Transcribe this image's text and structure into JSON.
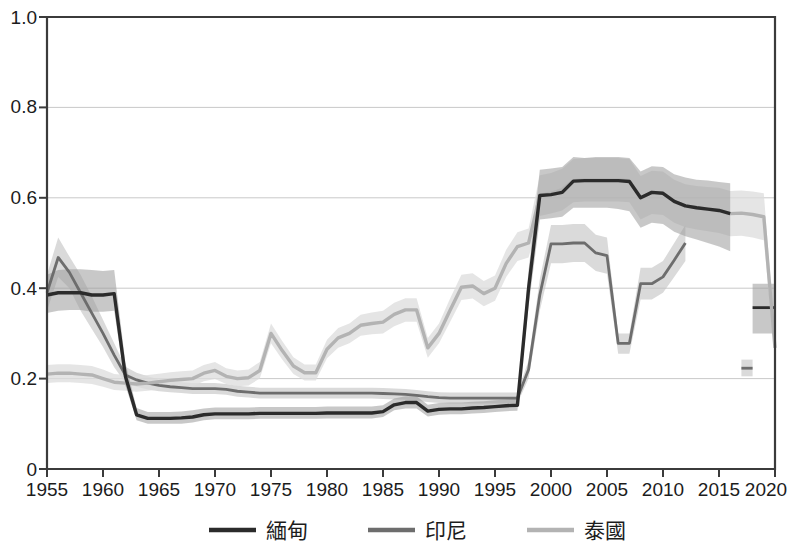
{
  "chart_data": {
    "type": "line",
    "title": "",
    "subtitle": "",
    "xlabel": "",
    "ylabel": "",
    "xlim": [
      1955,
      2020
    ],
    "ylim": [
      0,
      1.0
    ],
    "grid": true,
    "legend_position": "bottom",
    "x_ticks": [
      "1955",
      "1960",
      "1965",
      "1970",
      "1975",
      "1980",
      "1985",
      "1990",
      "1995",
      "2000",
      "2005",
      "2010",
      "2015",
      "2020"
    ],
    "x_tick_values": [
      1955,
      1960,
      1965,
      1970,
      1975,
      1980,
      1985,
      1990,
      1995,
      2000,
      2005,
      2010,
      2015,
      2020
    ],
    "y_ticks": [
      "0",
      "0.2",
      "0.4",
      "0.6",
      "0.8",
      "1.0"
    ],
    "y_tick_values": [
      0,
      0.2,
      0.4,
      0.6,
      0.8,
      1.0
    ],
    "series": [
      {
        "name": "緬甸",
        "color": "#2b2b2b",
        "band_color": "#9a9a9a",
        "band_opacity": 0.55,
        "x": [
          1955,
          1956,
          1957,
          1958,
          1959,
          1960,
          1961,
          1962,
          1963,
          1964,
          1965,
          1966,
          1967,
          1968,
          1969,
          1970,
          1971,
          1972,
          1973,
          1974,
          1975,
          1976,
          1977,
          1978,
          1979,
          1980,
          1981,
          1982,
          1983,
          1984,
          1985,
          1986,
          1987,
          1988,
          1989,
          1990,
          1991,
          1992,
          1993,
          1994,
          1995,
          1996,
          1997,
          1998,
          1999,
          2000,
          2001,
          2002,
          2003,
          2004,
          2005,
          2006,
          2007,
          2008,
          2009,
          2010,
          2011,
          2012,
          2013,
          2014,
          2015,
          2016
        ],
        "values": [
          0.385,
          0.39,
          0.39,
          0.39,
          0.385,
          0.385,
          0.388,
          0.205,
          0.12,
          0.112,
          0.112,
          0.112,
          0.113,
          0.115,
          0.12,
          0.122,
          0.122,
          0.122,
          0.122,
          0.123,
          0.123,
          0.123,
          0.123,
          0.123,
          0.123,
          0.124,
          0.124,
          0.124,
          0.124,
          0.124,
          0.127,
          0.142,
          0.147,
          0.147,
          0.128,
          0.132,
          0.133,
          0.133,
          0.135,
          0.136,
          0.138,
          0.14,
          0.141,
          0.4,
          0.605,
          0.607,
          0.612,
          0.637,
          0.638,
          0.638,
          0.638,
          0.638,
          0.636,
          0.6,
          0.612,
          0.61,
          0.592,
          0.582,
          0.578,
          0.575,
          0.572,
          0.565
        ],
        "lower": [
          0.345,
          0.35,
          0.352,
          0.352,
          0.348,
          0.348,
          0.35,
          0.185,
          0.108,
          0.1,
          0.1,
          0.1,
          0.1,
          0.103,
          0.108,
          0.11,
          0.11,
          0.11,
          0.11,
          0.111,
          0.111,
          0.111,
          0.111,
          0.111,
          0.111,
          0.112,
          0.112,
          0.112,
          0.112,
          0.112,
          0.115,
          0.13,
          0.134,
          0.134,
          0.116,
          0.12,
          0.121,
          0.121,
          0.123,
          0.124,
          0.126,
          0.128,
          0.129,
          0.36,
          0.552,
          0.555,
          0.558,
          0.578,
          0.578,
          0.578,
          0.578,
          0.575,
          0.57,
          0.534,
          0.545,
          0.542,
          0.525,
          0.515,
          0.508,
          0.5,
          0.492,
          0.482
        ],
        "upper": [
          0.43,
          0.44,
          0.442,
          0.442,
          0.44,
          0.438,
          0.44,
          0.235,
          0.135,
          0.126,
          0.126,
          0.126,
          0.127,
          0.13,
          0.134,
          0.136,
          0.136,
          0.136,
          0.136,
          0.137,
          0.137,
          0.137,
          0.137,
          0.137,
          0.137,
          0.138,
          0.138,
          0.138,
          0.138,
          0.138,
          0.141,
          0.156,
          0.161,
          0.161,
          0.142,
          0.146,
          0.147,
          0.147,
          0.149,
          0.15,
          0.152,
          0.154,
          0.155,
          0.44,
          0.662,
          0.665,
          0.668,
          0.69,
          0.688,
          0.69,
          0.69,
          0.69,
          0.688,
          0.658,
          0.67,
          0.668,
          0.652,
          0.645,
          0.64,
          0.638,
          0.635,
          0.632
        ]
      },
      {
        "name": "緬甸-tail",
        "color": "#2b2b2b",
        "band_color": "#9a9a9a",
        "band_opacity": 0.55,
        "legend_hidden": true,
        "x": [
          2018,
          2019,
          2020
        ],
        "values": [
          0.357,
          0.357,
          0.357
        ],
        "lower": [
          0.3,
          0.3,
          0.3
        ],
        "upper": [
          0.41,
          0.41,
          0.41
        ]
      },
      {
        "name": "印尼",
        "color": "#6d6d6d",
        "band_color": "#c2c2c2",
        "band_opacity": 0.6,
        "x": [
          1955,
          1956,
          1957,
          1958,
          1959,
          1960,
          1961,
          1962,
          1963,
          1964,
          1965,
          1966,
          1967,
          1968,
          1969,
          1970,
          1971,
          1972,
          1973,
          1974,
          1975,
          1976,
          1977,
          1978,
          1979,
          1980,
          1981,
          1982,
          1983,
          1984,
          1985,
          1986,
          1987,
          1988,
          1989,
          1990,
          1991,
          1992,
          1993,
          1994,
          1995,
          1996,
          1997,
          1998,
          1999,
          2000,
          2001,
          2002,
          2003,
          2004,
          2005,
          2006,
          2007,
          2008,
          2009,
          2010,
          2011,
          2012
        ],
        "values": [
          0.39,
          0.468,
          0.435,
          0.39,
          0.345,
          0.3,
          0.252,
          0.208,
          0.197,
          0.19,
          0.185,
          0.182,
          0.18,
          0.178,
          0.178,
          0.178,
          0.176,
          0.172,
          0.17,
          0.168,
          0.168,
          0.168,
          0.168,
          0.168,
          0.168,
          0.168,
          0.168,
          0.168,
          0.168,
          0.168,
          0.167,
          0.166,
          0.165,
          0.163,
          0.16,
          0.158,
          0.157,
          0.157,
          0.157,
          0.157,
          0.157,
          0.157,
          0.157,
          0.22,
          0.385,
          0.498,
          0.498,
          0.5,
          0.5,
          0.478,
          0.472,
          0.278,
          0.278,
          0.41,
          0.41,
          0.425,
          0.462,
          0.5
        ],
        "lower": [
          0.35,
          0.425,
          0.4,
          0.35,
          0.31,
          0.27,
          0.225,
          0.19,
          0.182,
          0.176,
          0.172,
          0.17,
          0.168,
          0.166,
          0.166,
          0.166,
          0.164,
          0.16,
          0.158,
          0.156,
          0.156,
          0.156,
          0.156,
          0.156,
          0.156,
          0.156,
          0.156,
          0.156,
          0.156,
          0.156,
          0.155,
          0.154,
          0.153,
          0.151,
          0.148,
          0.146,
          0.145,
          0.145,
          0.145,
          0.145,
          0.145,
          0.145,
          0.145,
          0.2,
          0.35,
          0.455,
          0.455,
          0.458,
          0.458,
          0.438,
          0.432,
          0.255,
          0.255,
          0.375,
          0.375,
          0.39,
          0.425,
          0.46
        ],
        "upper": [
          0.43,
          0.512,
          0.47,
          0.43,
          0.382,
          0.33,
          0.278,
          0.226,
          0.213,
          0.205,
          0.198,
          0.195,
          0.192,
          0.19,
          0.19,
          0.19,
          0.188,
          0.184,
          0.182,
          0.18,
          0.18,
          0.18,
          0.18,
          0.18,
          0.18,
          0.18,
          0.18,
          0.18,
          0.18,
          0.18,
          0.179,
          0.178,
          0.177,
          0.175,
          0.172,
          0.17,
          0.169,
          0.169,
          0.169,
          0.169,
          0.169,
          0.169,
          0.169,
          0.24,
          0.42,
          0.54,
          0.54,
          0.542,
          0.542,
          0.518,
          0.512,
          0.3,
          0.3,
          0.445,
          0.445,
          0.46,
          0.5,
          0.54
        ]
      },
      {
        "name": "印尼-tail",
        "color": "#6d6d6d",
        "band_color": "#c2c2c2",
        "band_opacity": 0.6,
        "legend_hidden": true,
        "x": [
          2017,
          2018
        ],
        "values": [
          0.223,
          0.223
        ],
        "lower": [
          0.205,
          0.205
        ],
        "upper": [
          0.242,
          0.242
        ]
      },
      {
        "name": "泰國",
        "color": "#b3b3b3",
        "band_color": "#dcdcdc",
        "band_opacity": 0.75,
        "x": [
          1955,
          1956,
          1957,
          1958,
          1959,
          1960,
          1961,
          1962,
          1963,
          1964,
          1965,
          1966,
          1967,
          1968,
          1969,
          1970,
          1971,
          1972,
          1973,
          1974,
          1975,
          1976,
          1977,
          1978,
          1979,
          1980,
          1981,
          1982,
          1983,
          1984,
          1985,
          1986,
          1987,
          1988,
          1989,
          1990,
          1991,
          1992,
          1993,
          1994,
          1995,
          1996,
          1997,
          1998,
          1999,
          2000,
          2001,
          2002,
          2003,
          2004,
          2005,
          2006,
          2007,
          2008,
          2009,
          2010,
          2011,
          2012,
          2013,
          2014,
          2015,
          2016,
          2017,
          2018,
          2019,
          2020
        ],
        "values": [
          0.21,
          0.212,
          0.212,
          0.21,
          0.208,
          0.2,
          0.192,
          0.19,
          0.188,
          0.19,
          0.193,
          0.196,
          0.198,
          0.2,
          0.212,
          0.218,
          0.205,
          0.2,
          0.202,
          0.218,
          0.3,
          0.262,
          0.228,
          0.213,
          0.213,
          0.265,
          0.29,
          0.3,
          0.318,
          0.322,
          0.325,
          0.342,
          0.352,
          0.352,
          0.268,
          0.3,
          0.352,
          0.402,
          0.405,
          0.388,
          0.4,
          0.455,
          0.492,
          0.5,
          0.605,
          0.61,
          0.618,
          0.638,
          0.64,
          0.64,
          0.64,
          0.64,
          0.638,
          0.6,
          0.612,
          0.61,
          0.592,
          0.582,
          0.578,
          0.575,
          0.572,
          0.565,
          0.566,
          0.563,
          0.558,
          0.268
        ],
        "lower": [
          0.19,
          0.192,
          0.192,
          0.19,
          0.188,
          0.182,
          0.175,
          0.173,
          0.171,
          0.173,
          0.176,
          0.179,
          0.181,
          0.183,
          0.194,
          0.199,
          0.188,
          0.183,
          0.185,
          0.2,
          0.278,
          0.242,
          0.21,
          0.196,
          0.196,
          0.245,
          0.268,
          0.278,
          0.295,
          0.298,
          0.3,
          0.316,
          0.326,
          0.326,
          0.246,
          0.278,
          0.326,
          0.374,
          0.377,
          0.36,
          0.372,
          0.425,
          0.46,
          0.468,
          0.56,
          0.565,
          0.572,
          0.59,
          0.592,
          0.592,
          0.592,
          0.592,
          0.59,
          0.552,
          0.564,
          0.562,
          0.545,
          0.535,
          0.53,
          0.526,
          0.522,
          0.515,
          0.516,
          0.512,
          0.506,
          0.245
        ],
        "upper": [
          0.23,
          0.232,
          0.232,
          0.23,
          0.228,
          0.22,
          0.21,
          0.208,
          0.206,
          0.208,
          0.211,
          0.214,
          0.216,
          0.218,
          0.23,
          0.237,
          0.223,
          0.218,
          0.22,
          0.237,
          0.322,
          0.283,
          0.247,
          0.231,
          0.231,
          0.286,
          0.312,
          0.322,
          0.341,
          0.346,
          0.35,
          0.368,
          0.378,
          0.378,
          0.29,
          0.322,
          0.378,
          0.43,
          0.433,
          0.416,
          0.428,
          0.485,
          0.524,
          0.532,
          0.65,
          0.655,
          0.664,
          0.686,
          0.688,
          0.688,
          0.688,
          0.688,
          0.686,
          0.648,
          0.66,
          0.658,
          0.64,
          0.63,
          0.626,
          0.624,
          0.622,
          0.615,
          0.616,
          0.614,
          0.61,
          0.292
        ]
      }
    ],
    "legend": [
      {
        "label": "緬甸",
        "color": "#2b2b2b"
      },
      {
        "label": "印尼",
        "color": "#6d6d6d"
      },
      {
        "label": "泰國",
        "color": "#b3b3b3"
      }
    ]
  },
  "axes": {
    "y_tick_0": "0",
    "y_tick_1": "0.2",
    "y_tick_2": "0.4",
    "y_tick_3": "0.6",
    "y_tick_4": "0.8",
    "y_tick_5": "1.0",
    "x_tick_0": "1955",
    "x_tick_1": "1960",
    "x_tick_2": "1965",
    "x_tick_3": "1970",
    "x_tick_4": "1975",
    "x_tick_5": "1980",
    "x_tick_6": "1985",
    "x_tick_7": "1990",
    "x_tick_8": "1995",
    "x_tick_9": "2000",
    "x_tick_10": "2005",
    "x_tick_11": "2010",
    "x_tick_12": "2015",
    "x_tick_13": "2020"
  },
  "legend": {
    "item_0": "緬甸",
    "item_1": "印尼",
    "item_2": "泰國"
  }
}
